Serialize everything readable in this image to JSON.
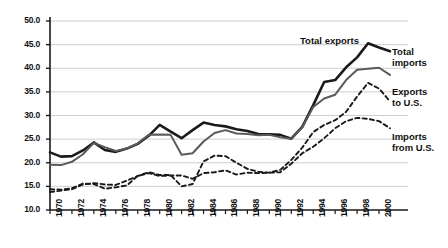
{
  "chart_data": {
    "type": "line",
    "title": "",
    "subtitle": "",
    "xlabel": "",
    "ylabel": "",
    "xlim": [
      1970,
      2001
    ],
    "ylim": [
      10.0,
      50.0
    ],
    "grid": true,
    "legend_position": "inline-annotations",
    "y_ticks": [
      "10.0",
      "15.0",
      "20.0",
      "25.0",
      "30.0",
      "35.0",
      "40.0",
      "45.0",
      "50.0"
    ],
    "y_tick_values": [
      10.0,
      15.0,
      20.0,
      25.0,
      30.0,
      35.0,
      40.0,
      45.0,
      50.0
    ],
    "x_tick_labels": [
      "1970",
      "1972",
      "1974",
      "1976",
      "1978",
      "1980",
      "1982",
      "1984",
      "1986",
      "1988",
      "1990",
      "1992",
      "1994",
      "1996",
      "1998",
      "2000"
    ],
    "x_tick_values": [
      1970,
      1972,
      1974,
      1976,
      1978,
      1980,
      1982,
      1984,
      1986,
      1988,
      1990,
      1992,
      1994,
      1996,
      1998,
      2000
    ],
    "x_minor_ticks": [
      1970,
      1971,
      1972,
      1973,
      1974,
      1975,
      1976,
      1977,
      1978,
      1979,
      1980,
      1981,
      1982,
      1983,
      1984,
      1985,
      1986,
      1987,
      1988,
      1989,
      1990,
      1991,
      1992,
      1993,
      1994,
      1995,
      1996,
      1997,
      1998,
      1999,
      2000,
      2001
    ],
    "x": [
      1970,
      1971,
      1972,
      1973,
      1974,
      1975,
      1976,
      1977,
      1978,
      1979,
      1980,
      1981,
      1982,
      1983,
      1984,
      1985,
      1986,
      1987,
      1988,
      1989,
      1990,
      1991,
      1992,
      1993,
      1994,
      1995,
      1996,
      1997,
      1998,
      1999,
      2000,
      2001
    ],
    "series": [
      {
        "name": "Total exports",
        "style": "solid",
        "color": "#1a1a1a",
        "width": 2.6,
        "values": [
          22.2,
          21.3,
          21.4,
          22.6,
          24.3,
          22.7,
          22.3,
          23.0,
          24.0,
          25.7,
          28.0,
          26.6,
          25.2,
          26.9,
          28.5,
          28.0,
          27.7,
          27.1,
          26.7,
          26.1,
          26.0,
          25.9,
          25.1,
          27.6,
          32.2,
          37.1,
          37.5,
          40.2,
          42.3,
          45.3,
          44.4,
          43.6
        ]
      },
      {
        "name": "Total imports",
        "style": "solid",
        "color": "#5a5a5a",
        "width": 2.0,
        "values": [
          19.6,
          19.5,
          20.2,
          21.8,
          24.2,
          23.3,
          22.5,
          23.0,
          24.1,
          25.9,
          26.0,
          25.9,
          21.7,
          22.0,
          24.5,
          26.3,
          26.9,
          26.2,
          26.1,
          25.8,
          25.9,
          25.4,
          25.1,
          27.5,
          31.8,
          33.6,
          34.4,
          37.5,
          39.7,
          39.9,
          40.1,
          38.6
        ]
      },
      {
        "name": "Exports to U.S.",
        "style": "dashed",
        "color": "#1a1a1a",
        "width": 1.9,
        "values": [
          13.8,
          14.1,
          14.4,
          15.4,
          15.7,
          15.4,
          15.3,
          16.2,
          17.2,
          18.0,
          17.4,
          17.4,
          15.0,
          15.5,
          20.3,
          21.5,
          21.4,
          20.0,
          18.7,
          18.1,
          17.9,
          18.5,
          20.6,
          23.2,
          26.5,
          28.0,
          29.0,
          30.8,
          34.0,
          36.9,
          35.7,
          33.0
        ]
      },
      {
        "name": "Imports from U.S.",
        "style": "dashed",
        "color": "#1a1a1a",
        "width": 1.9,
        "values": [
          14.4,
          14.3,
          14.6,
          15.6,
          15.5,
          14.5,
          14.8,
          15.2,
          17.2,
          17.8,
          17.2,
          17.3,
          17.3,
          16.6,
          17.8,
          18.0,
          18.4,
          17.5,
          17.9,
          17.8,
          17.9,
          18.0,
          19.8,
          22.0,
          23.4,
          25.2,
          27.3,
          28.8,
          29.5,
          29.3,
          28.8,
          27.3
        ]
      }
    ],
    "annotations": [
      {
        "text": "Total exports",
        "series": "Total exports"
      },
      {
        "text": "Total",
        "series": "Total imports"
      },
      {
        "text": "imports",
        "series": "Total imports"
      },
      {
        "text": "Exports",
        "series": "Exports to U.S."
      },
      {
        "text": "to U.S.",
        "series": "Exports to U.S."
      },
      {
        "text": "Imports",
        "series": "Imports from U.S."
      },
      {
        "text": "from U.S.",
        "series": "Imports from U.S."
      }
    ]
  },
  "annotation_labels": {
    "total_exports": "Total exports",
    "total_imports_line1": "Total",
    "total_imports_line2": "imports",
    "exports_us_line1": "Exports",
    "exports_us_line2": "to U.S.",
    "imports_us_line1": "Imports",
    "imports_us_line2": "from U.S."
  },
  "colors": {
    "background": "#ffffff",
    "axis": "#1a1a1a",
    "grid": "#b8b8b8",
    "total_exports": "#1a1a1a",
    "total_imports": "#5a5a5a",
    "exports_to_us": "#1a1a1a",
    "imports_from_us": "#1a1a1a"
  }
}
